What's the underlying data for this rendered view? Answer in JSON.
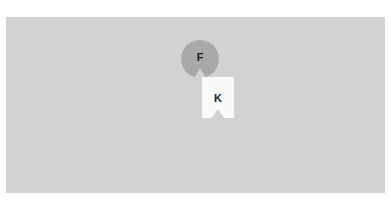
{
  "canvas": {
    "name": "shape-canvas",
    "background_color": "#d2d2d2",
    "page_background_color": "#ffffff",
    "x": 6,
    "y": 17,
    "width": 379,
    "height": 176
  },
  "shapes": [
    {
      "id": "shape-f",
      "kind": "notched-circle",
      "label": "F",
      "fill": "#a9a9a9",
      "label_color": "#1c1c1c",
      "cx": 200,
      "cy": 59,
      "r": 19,
      "notch_width": 11,
      "notch_depth": 9,
      "label_x": 200,
      "label_y": 58
    },
    {
      "id": "shape-k",
      "kind": "notched-square",
      "label": "K",
      "fill": "#fafafa",
      "label_color": "#1c1c1c",
      "x": 202,
      "y": 77,
      "width": 32,
      "height": 41,
      "notch_width": 13,
      "notch_depth": 9,
      "label_x": 218,
      "label_y": 99
    }
  ]
}
